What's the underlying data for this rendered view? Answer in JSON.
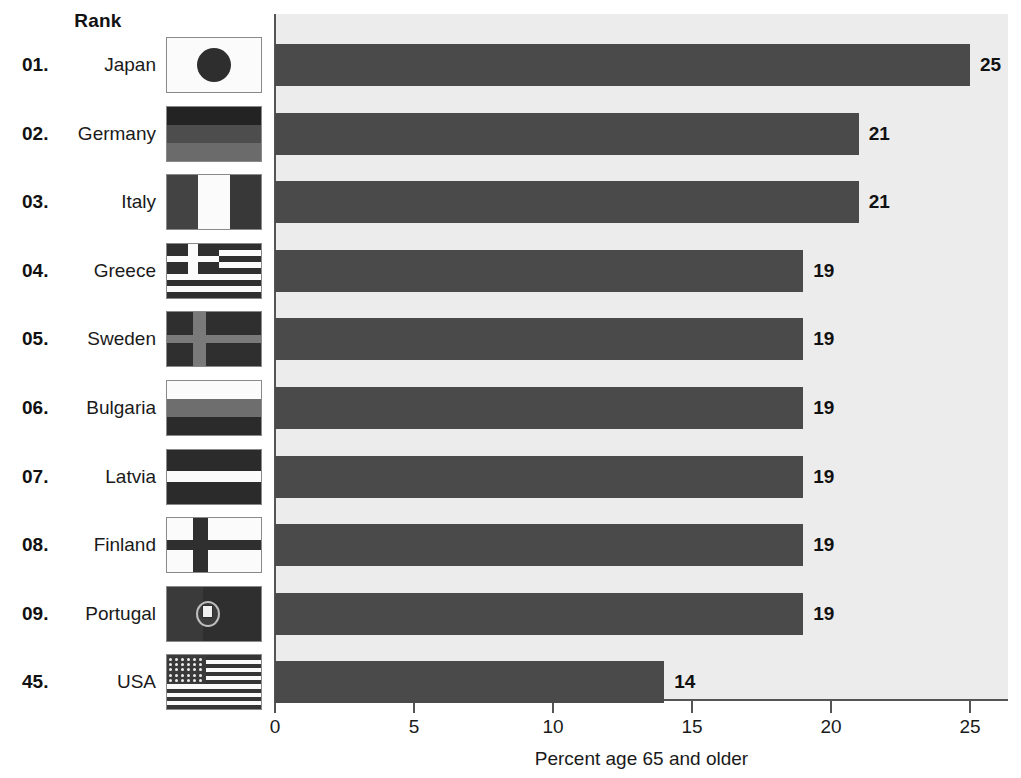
{
  "header": {
    "rank_label": "Rank"
  },
  "chart_data": {
    "type": "bar",
    "orientation": "horizontal",
    "title": "",
    "xlabel": "Percent age 65 and older",
    "ylabel": "",
    "xlim": [
      0,
      27
    ],
    "xticks": [
      0,
      5,
      10,
      15,
      20,
      25
    ],
    "xtick_labels": [
      "0",
      "5",
      "10",
      "15",
      "20",
      "25"
    ],
    "grid": false,
    "legend": false,
    "bar_color": "#4a4a4a",
    "plot_background": "#ececec",
    "page_background": "#ffffff",
    "categories": [
      "Japan",
      "Germany",
      "Italy",
      "Greece",
      "Sweden",
      "Bulgaria",
      "Latvia",
      "Finland",
      "Portugal",
      "USA"
    ],
    "values": [
      25,
      21,
      21,
      19,
      19,
      19,
      19,
      19,
      19,
      14
    ],
    "value_labels": [
      "25",
      "21",
      "21",
      "19",
      "19",
      "19",
      "19",
      "19",
      "19",
      "14"
    ],
    "ranks": [
      "01.",
      "02.",
      "03.",
      "04.",
      "05.",
      "06.",
      "07.",
      "08.",
      "09.",
      "45."
    ]
  },
  "rows": [
    {
      "rank": "01.",
      "country": "Japan",
      "value": 25,
      "value_label": "25",
      "flag": "flag-japan"
    },
    {
      "rank": "02.",
      "country": "Germany",
      "value": 21,
      "value_label": "21",
      "flag": "flag-germany"
    },
    {
      "rank": "03.",
      "country": "Italy",
      "value": 21,
      "value_label": "21",
      "flag": "flag-italy"
    },
    {
      "rank": "04.",
      "country": "Greece",
      "value": 19,
      "value_label": "19",
      "flag": "flag-greece"
    },
    {
      "rank": "05.",
      "country": "Sweden",
      "value": 19,
      "value_label": "19",
      "flag": "flag-sweden"
    },
    {
      "rank": "06.",
      "country": "Bulgaria",
      "value": 19,
      "value_label": "19",
      "flag": "flag-bulgaria"
    },
    {
      "rank": "07.",
      "country": "Latvia",
      "value": 19,
      "value_label": "19",
      "flag": "flag-latvia"
    },
    {
      "rank": "08.",
      "country": "Finland",
      "value": 19,
      "value_label": "19",
      "flag": "flag-finland"
    },
    {
      "rank": "09.",
      "country": "Portugal",
      "value": 19,
      "value_label": "19",
      "flag": "flag-portugal"
    },
    {
      "rank": "45.",
      "country": "USA",
      "value": 14,
      "value_label": "14",
      "flag": "flag-usa"
    }
  ],
  "axis": {
    "title": "Percent age 65 and older",
    "ticks": [
      "0",
      "5",
      "10",
      "15",
      "20",
      "25"
    ]
  }
}
